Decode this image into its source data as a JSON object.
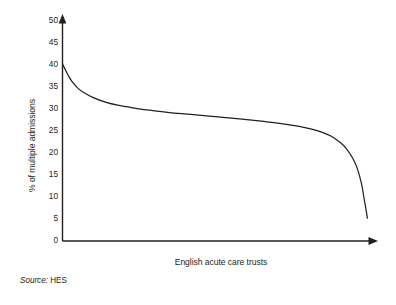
{
  "chart_data": {
    "type": "line",
    "title": "",
    "subtitle": "",
    "xlabel": "English acute care trusts",
    "ylabel": "% of multiple admissions",
    "ylim": [
      0,
      50
    ],
    "ytick_labels": [
      "50",
      "45",
      "40",
      "35",
      "30",
      "25",
      "20",
      "15",
      "10",
      "5",
      "0"
    ],
    "ytick_values": [
      50,
      45,
      40,
      35,
      30,
      25,
      20,
      15,
      10,
      5,
      0
    ],
    "xtick_labels": [],
    "grid": false,
    "legend": null,
    "axis_style": "arrow-ended-x-and-y",
    "series": [
      {
        "name": "% of multiple admissions by trust (ranked)",
        "x": [
          0,
          1,
          2,
          3,
          5,
          7,
          10,
          14,
          18,
          23,
          29,
          35,
          42,
          50,
          58,
          66,
          74,
          81,
          85,
          88,
          91,
          93,
          95,
          96.5,
          98,
          99,
          100
        ],
        "values": [
          40.0,
          38.6,
          37.3,
          36.2,
          34.6,
          33.6,
          32.5,
          31.5,
          30.8,
          30.2,
          29.6,
          29.1,
          28.7,
          28.2,
          27.7,
          27.1,
          26.4,
          25.5,
          24.7,
          23.8,
          22.4,
          21.0,
          19.0,
          16.8,
          13.2,
          9.3,
          5.2
        ]
      }
    ]
  },
  "annotations": {
    "source_label": "Source:",
    "source_value": "HES"
  },
  "colors": {
    "curve": "#231f20",
    "axis": "#231f20",
    "background": "#ffffff",
    "text": "#231f20"
  }
}
